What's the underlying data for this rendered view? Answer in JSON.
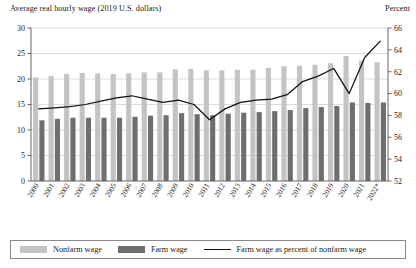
{
  "header": {
    "left_axis_title": "Average real hourly wage (2019 U.S. dollars)",
    "right_axis_title": "Percent"
  },
  "legend": {
    "nonfarm_label": "Nonfarm wage",
    "farm_label": "Farm wage",
    "line_label": "Farm wage as percent of nonfarm wage"
  },
  "colors": {
    "nonfarm_bar": "#c3c3c3",
    "farm_bar": "#6e6e6e",
    "line": "#111111",
    "grid": "#b9b9b9",
    "axis": "#555555"
  },
  "chart_data": {
    "type": "bar",
    "title": "",
    "xlabel": "",
    "ylabel": "Average real hourly wage (2019 U.S. dollars)",
    "y2label": "Percent",
    "ylim": [
      0,
      30
    ],
    "y2lim": [
      52,
      66
    ],
    "yticks": [
      0,
      5,
      10,
      15,
      20,
      25,
      30
    ],
    "y2ticks": [
      52,
      54,
      56,
      58,
      60,
      62,
      64,
      66
    ],
    "ytick_labels": [
      "0",
      "5",
      "10",
      "15",
      "20",
      "25",
      "30"
    ],
    "y2tick_labels": [
      "52",
      "54",
      "56",
      "58",
      "60",
      "62",
      "64",
      "66"
    ],
    "grid": true,
    "legend_position": "bottom",
    "categories": [
      "2000",
      "2001",
      "2002",
      "2003",
      "2004",
      "2005",
      "2006",
      "2007",
      "2008",
      "2009",
      "2010",
      "2011",
      "2012",
      "2013",
      "2014",
      "2015",
      "2016",
      "2017",
      "2018",
      "2019",
      "2020",
      "2021",
      "2022*"
    ],
    "series": [
      {
        "name": "Nonfarm wage",
        "type": "bar",
        "axis": "left",
        "values": [
          20.3,
          20.6,
          21.0,
          21.2,
          21.1,
          21.0,
          21.1,
          21.3,
          21.3,
          21.9,
          22.0,
          21.7,
          21.7,
          21.8,
          21.8,
          22.2,
          22.5,
          22.6,
          22.8,
          23.1,
          24.5,
          23.6,
          23.3
        ]
      },
      {
        "name": "Farm wage",
        "type": "bar",
        "axis": "left",
        "values": [
          11.9,
          12.2,
          12.4,
          12.4,
          12.4,
          12.4,
          12.6,
          12.8,
          12.9,
          13.3,
          13.1,
          12.9,
          13.2,
          13.4,
          13.5,
          13.7,
          13.9,
          14.3,
          14.5,
          14.7,
          15.4,
          15.3,
          15.4
        ]
      },
      {
        "name": "Farm wage as percent of nonfarm wage",
        "type": "line",
        "axis": "right",
        "values": [
          58.6,
          58.7,
          58.8,
          59.0,
          59.3,
          59.6,
          59.8,
          59.5,
          59.2,
          59.4,
          59.0,
          57.6,
          58.6,
          59.2,
          59.4,
          59.5,
          59.9,
          61.1,
          61.6,
          62.3,
          60.0,
          63.3,
          64.8
        ]
      }
    ]
  }
}
